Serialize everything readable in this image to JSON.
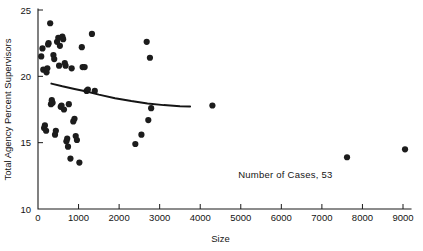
{
  "chart_data": {
    "type": "scatter",
    "title": "",
    "xlabel": "Size",
    "ylabel": "Total Agency Percent Supervisors",
    "xlim": [
      0,
      9200
    ],
    "ylim": [
      10,
      25
    ],
    "grid": false,
    "legend": null,
    "x_ticks": [
      0,
      1000,
      2000,
      3000,
      4000,
      5000,
      6000,
      7000,
      8000,
      9000
    ],
    "x_tick_labels": [
      "0",
      "1000",
      "2000",
      "3000",
      "4000",
      "5000",
      "6000",
      "7000",
      "8000",
      "9000"
    ],
    "y_ticks": [
      10,
      15,
      20,
      25
    ],
    "y_tick_labels": [
      "10",
      "15",
      "20",
      "25"
    ],
    "annotations": [
      {
        "text": "Number of Cases, 53",
        "x": 6100,
        "y": 12.3
      }
    ],
    "series": [
      {
        "name": "agencies",
        "marker": "filled-circle",
        "color": "#1c1c1c",
        "points": [
          [
            80,
            21.5
          ],
          [
            110,
            22.1
          ],
          [
            130,
            20.5
          ],
          [
            150,
            16.1
          ],
          [
            170,
            16.3
          ],
          [
            200,
            15.9
          ],
          [
            210,
            20.3
          ],
          [
            230,
            20.6
          ],
          [
            250,
            22.4
          ],
          [
            260,
            22.5
          ],
          [
            300,
            24.0
          ],
          [
            320,
            17.9
          ],
          [
            340,
            18.2
          ],
          [
            360,
            18.0
          ],
          [
            380,
            21.6
          ],
          [
            400,
            21.3
          ],
          [
            420,
            15.6
          ],
          [
            440,
            15.9
          ],
          [
            470,
            22.6
          ],
          [
            500,
            22.9
          ],
          [
            520,
            20.8
          ],
          [
            540,
            22.3
          ],
          [
            560,
            17.7
          ],
          [
            580,
            17.8
          ],
          [
            600,
            23.0
          ],
          [
            620,
            22.8
          ],
          [
            640,
            17.5
          ],
          [
            660,
            21.0
          ],
          [
            680,
            20.8
          ],
          [
            700,
            15.1
          ],
          [
            720,
            15.3
          ],
          [
            740,
            14.7
          ],
          [
            760,
            17.9
          ],
          [
            800,
            13.8
          ],
          [
            830,
            20.6
          ],
          [
            870,
            16.6
          ],
          [
            900,
            16.8
          ],
          [
            930,
            15.5
          ],
          [
            960,
            15.2
          ],
          [
            1020,
            13.5
          ],
          [
            1080,
            22.2
          ],
          [
            1100,
            20.7
          ],
          [
            1150,
            20.7
          ],
          [
            1200,
            18.9
          ],
          [
            1230,
            19.0
          ],
          [
            1330,
            23.2
          ],
          [
            1400,
            18.9
          ],
          [
            2400,
            14.9
          ],
          [
            2550,
            15.6
          ],
          [
            2680,
            22.6
          ],
          [
            2720,
            16.7
          ],
          [
            2760,
            21.4
          ],
          [
            2790,
            17.6
          ],
          [
            4300,
            17.8
          ],
          [
            7620,
            13.9
          ],
          [
            9050,
            14.5
          ]
        ]
      }
    ],
    "fit_curve": {
      "name": "fitted-trend",
      "color": "#151515",
      "points": [
        [
          330,
          19.45
        ],
        [
          600,
          19.25
        ],
        [
          900,
          19.05
        ],
        [
          1200,
          18.85
        ],
        [
          1500,
          18.62
        ],
        [
          1900,
          18.35
        ],
        [
          2300,
          18.14
        ],
        [
          2700,
          17.96
        ],
        [
          3100,
          17.83
        ],
        [
          3500,
          17.75
        ],
        [
          3750,
          17.72
        ]
      ]
    }
  },
  "axes": {
    "x_axis_name": "Size",
    "y_axis_name": "Total Agency Percent Supervisors"
  },
  "notes": {
    "cases_label": "Number of Cases, 53"
  }
}
